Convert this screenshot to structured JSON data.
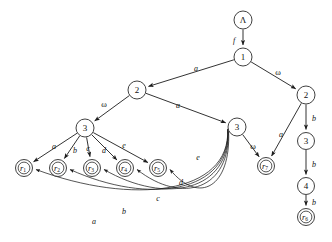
{
  "figure": {
    "kind": "directed-graph"
  },
  "nodes": [
    {
      "id": "root",
      "label": "Λ",
      "x": 243,
      "y": 20,
      "r": 9,
      "type": "plain"
    },
    {
      "id": "n1",
      "label": "1",
      "x": 243,
      "y": 57,
      "r": 9,
      "type": "plain"
    },
    {
      "id": "n2L",
      "label": "2",
      "x": 137,
      "y": 90,
      "r": 9,
      "type": "plain"
    },
    {
      "id": "n2R",
      "label": "2",
      "x": 306,
      "y": 95,
      "r": 9,
      "type": "plain"
    },
    {
      "id": "n3L",
      "label": "3",
      "x": 85,
      "y": 128,
      "r": 9,
      "type": "plain"
    },
    {
      "id": "n3M",
      "label": "3",
      "x": 237,
      "y": 127,
      "r": 9,
      "type": "plain"
    },
    {
      "id": "n3R",
      "label": "3",
      "x": 306,
      "y": 141,
      "r": 8.5,
      "type": "plain"
    },
    {
      "id": "n4R",
      "label": "4",
      "x": 306,
      "y": 186,
      "r": 8.5,
      "type": "plain"
    },
    {
      "id": "r1",
      "label": "r",
      "sub": "1",
      "x": 24,
      "y": 168,
      "r": 8.5,
      "type": "accept"
    },
    {
      "id": "r2",
      "label": "r",
      "sub": "2",
      "x": 58,
      "y": 168,
      "r": 8.5,
      "type": "accept"
    },
    {
      "id": "r3",
      "label": "r",
      "sub": "3",
      "x": 92,
      "y": 168,
      "r": 8.5,
      "type": "accept"
    },
    {
      "id": "r4",
      "label": "r",
      "sub": "4",
      "x": 125,
      "y": 168,
      "r": 8.5,
      "type": "accept"
    },
    {
      "id": "r5",
      "label": "r",
      "sub": "5",
      "x": 158,
      "y": 168,
      "r": 8.5,
      "type": "accept"
    },
    {
      "id": "r7",
      "label": "r",
      "sub": "7",
      "x": 266,
      "y": 166,
      "r": 8.5,
      "type": "accept"
    },
    {
      "id": "r6",
      "label": "r",
      "sub": "6",
      "x": 306,
      "y": 217,
      "r": 8.5,
      "type": "accept"
    }
  ],
  "edges": [
    {
      "from": "root",
      "to": "n1",
      "label": "f",
      "label_x": 234,
      "label_y": 40,
      "style": "straight"
    },
    {
      "from": "n1",
      "to": "n2L",
      "label": "a",
      "label_x": 196,
      "label_y": 68,
      "style": "straight"
    },
    {
      "from": "n1",
      "to": "n2R",
      "label": "ω",
      "label_x": 278,
      "label_y": 72,
      "style": "straight"
    },
    {
      "from": "n2L",
      "to": "n3L",
      "label": "ω",
      "label_x": 104,
      "label_y": 104,
      "style": "straight"
    },
    {
      "from": "n2L",
      "to": "n3M",
      "label": "a",
      "label_x": 178,
      "label_y": 105,
      "style": "straight"
    },
    {
      "from": "n2R",
      "to": "n3R",
      "label": "b",
      "label_x": 314,
      "label_y": 118,
      "style": "straight"
    },
    {
      "from": "n3R",
      "to": "n4R",
      "label": "b",
      "label_x": 314,
      "label_y": 164,
      "style": "straight"
    },
    {
      "from": "n4R",
      "to": "r6",
      "label": "b",
      "label_x": 314,
      "label_y": 202,
      "style": "straight"
    },
    {
      "from": "n2R",
      "to": "r7",
      "label": "a",
      "label_x": 281,
      "label_y": 134,
      "style": "straight"
    },
    {
      "from": "n3M",
      "to": "r7",
      "label": "ω",
      "label_x": 253,
      "label_y": 146,
      "style": "straight"
    },
    {
      "from": "n3L",
      "to": "r1",
      "label": "a",
      "label_x": 54,
      "label_y": 146,
      "style": "straight"
    },
    {
      "from": "n3L",
      "to": "r2",
      "label": "b",
      "label_x": 75,
      "label_y": 150,
      "style": "straight"
    },
    {
      "from": "n3L",
      "to": "r3",
      "label": "c",
      "label_x": 88,
      "label_y": 148,
      "style": "straight"
    },
    {
      "from": "n3L",
      "to": "r4",
      "label": "d",
      "label_x": 104,
      "label_y": 150,
      "style": "straight"
    },
    {
      "from": "n3L",
      "to": "r5",
      "label": "e",
      "label_x": 124,
      "label_y": 145,
      "style": "straight"
    },
    {
      "from": "n3M",
      "to": "r5",
      "label": "e",
      "label_x": 198,
      "label_y": 157,
      "style": "arc"
    },
    {
      "from": "n3M",
      "to": "r4",
      "label": "d",
      "label_x": 181,
      "label_y": 182,
      "style": "arc"
    },
    {
      "from": "n3M",
      "to": "r3",
      "label": "c",
      "label_x": 158,
      "label_y": 198,
      "style": "arc"
    },
    {
      "from": "n3M",
      "to": "r2",
      "label": "b",
      "label_x": 124,
      "label_y": 211,
      "style": "arc"
    },
    {
      "from": "n3M",
      "to": "r1",
      "label": "a",
      "label_x": 94,
      "label_y": 221,
      "style": "arc"
    }
  ],
  "alphabet": [
    "a",
    "b",
    "c",
    "d",
    "e",
    "f",
    "ω"
  ],
  "accepting_states": [
    "r1",
    "r2",
    "r3",
    "r4",
    "r5",
    "r6",
    "r7"
  ],
  "internal_states": [
    "Λ",
    "1",
    "2",
    "3",
    "4"
  ]
}
